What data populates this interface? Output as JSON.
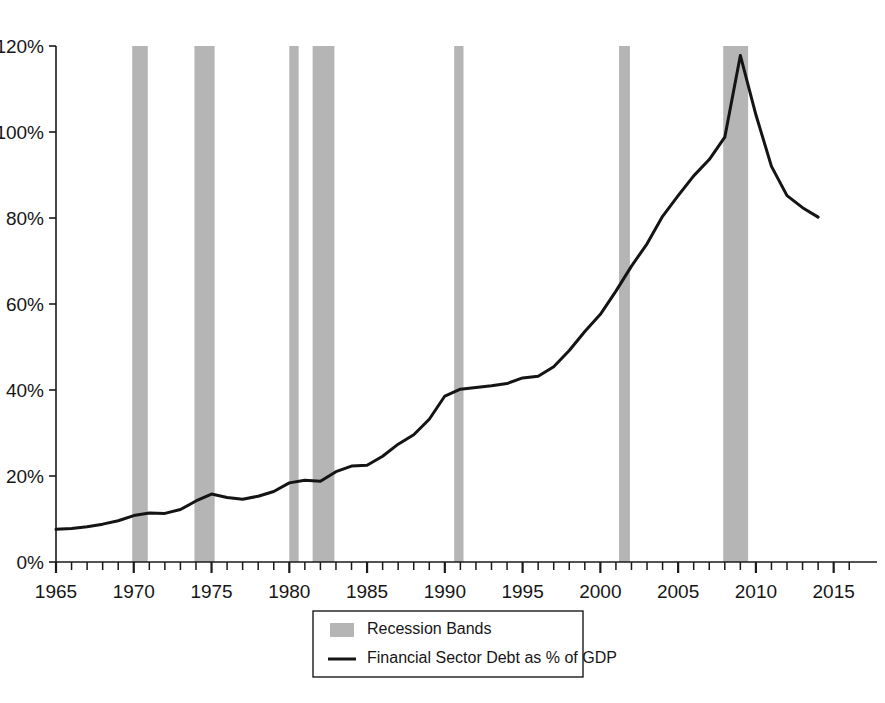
{
  "chart_data": {
    "type": "line",
    "title": "",
    "xlabel": "",
    "ylabel": "",
    "xlim": [
      1965,
      2016.5
    ],
    "ylim": [
      0,
      120
    ],
    "grid": false,
    "legend_position": "bottom-center",
    "y_ticks": [
      0,
      20,
      40,
      60,
      80,
      100,
      120
    ],
    "y_tick_labels": [
      "0%",
      "20%",
      "40%",
      "60%",
      "80%",
      "100%",
      "120%"
    ],
    "x_ticks": [
      1965,
      1970,
      1975,
      1980,
      1985,
      1990,
      1995,
      2000,
      2005,
      2010,
      2015
    ],
    "x_tick_labels": [
      "1965",
      "1970",
      "1975",
      "1980",
      "1985",
      "1990",
      "1995",
      "2000",
      "2005",
      "2010",
      "2015"
    ],
    "x_minor_tick_step": 1,
    "series": [
      {
        "name": "Financial Sector Debt as % of GDP",
        "color": "#141414",
        "type": "line",
        "x": [
          1965,
          1966,
          1967,
          1968,
          1969,
          1970,
          1971,
          1972,
          1973,
          1974,
          1975,
          1976,
          1977,
          1978,
          1979,
          1980,
          1981,
          1982,
          1983,
          1984,
          1985,
          1986,
          1987,
          1988,
          1989,
          1990,
          1991,
          1992,
          1993,
          1994,
          1995,
          1996,
          1997,
          1998,
          1999,
          2000,
          2001,
          2002,
          2003,
          2004,
          2005,
          2006,
          2007,
          2008,
          2009,
          2010,
          2011,
          2012,
          2013,
          2014
        ],
        "values": [
          7.6,
          7.8,
          8.2,
          8.8,
          9.6,
          10.8,
          11.4,
          11.3,
          12.2,
          14.2,
          15.8,
          15.0,
          14.6,
          15.3,
          16.4,
          18.4,
          19.0,
          18.8,
          21.0,
          22.3,
          22.5,
          24.6,
          27.4,
          29.6,
          33.2,
          38.6,
          40.2,
          40.6,
          41.0,
          41.5,
          42.8,
          43.2,
          45.4,
          49.2,
          53.6,
          57.6,
          63.0,
          68.8,
          74.0,
          80.4,
          85.2,
          89.8,
          93.6,
          98.8,
          117.8,
          104.0,
          92.0,
          85.2,
          82.4,
          80.2
        ]
      }
    ],
    "recession_bands": {
      "name": "Recession Bands",
      "color": "#b5b5b5",
      "intervals": [
        {
          "start": 1969.9,
          "end": 1970.9
        },
        {
          "start": 1973.9,
          "end": 1975.2
        },
        {
          "start": 1980.0,
          "end": 1980.6
        },
        {
          "start": 1981.5,
          "end": 1982.9
        },
        {
          "start": 1990.6,
          "end": 1991.2
        },
        {
          "start": 2001.2,
          "end": 2001.9
        },
        {
          "start": 2007.9,
          "end": 2009.5
        }
      ]
    },
    "legend": [
      {
        "label": "Recession Bands",
        "marker": "swatch",
        "color": "#b5b5b5"
      },
      {
        "label": "Financial Sector Debt as % of GDP",
        "marker": "line",
        "color": "#141414"
      }
    ]
  }
}
